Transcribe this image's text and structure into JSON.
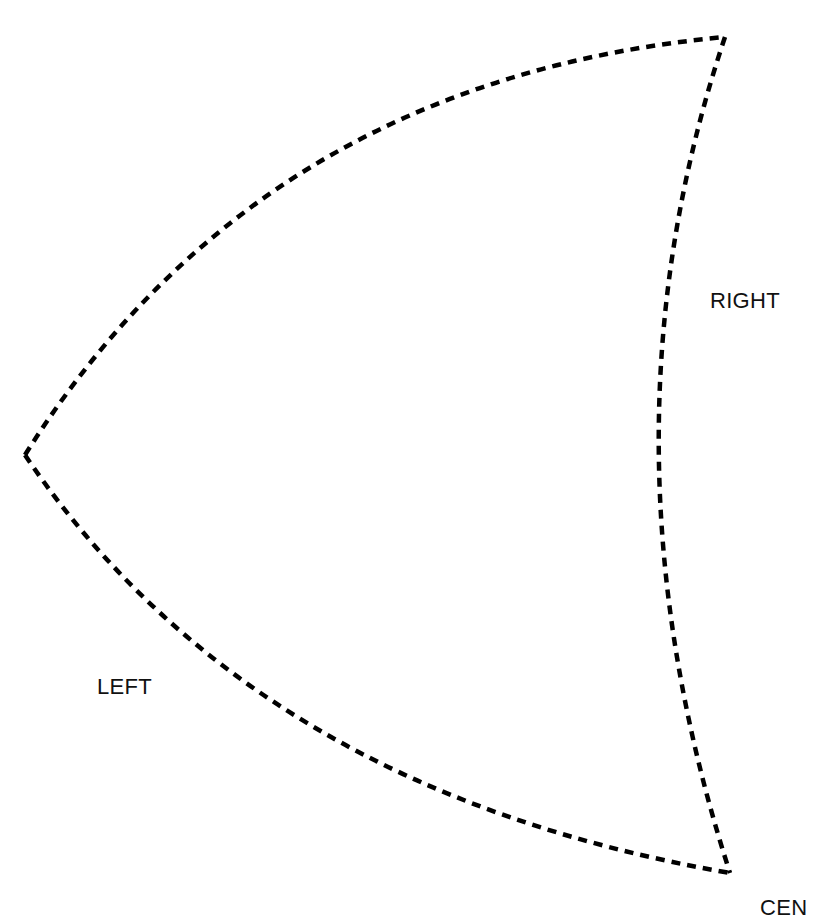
{
  "diagram": {
    "shape": {
      "type": "curved-triangle",
      "stroke_color": "#000000",
      "stroke_style": "dashed",
      "vertices": {
        "top_right": [
          725,
          37
        ],
        "left": [
          25,
          455
        ],
        "bottom_right": [
          730,
          873
        ]
      }
    },
    "labels": {
      "right": "RIGHT",
      "left": "LEFT",
      "center": "CEN"
    }
  }
}
